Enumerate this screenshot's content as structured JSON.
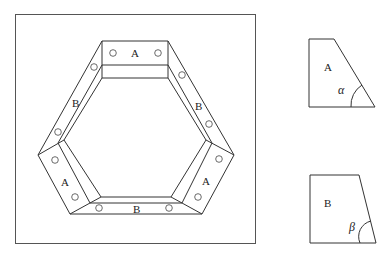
{
  "figure": {
    "frame_labels": {
      "top": "A",
      "upper_left": "B",
      "upper_right": "B",
      "lower_left": "A",
      "lower_right": "A",
      "bottom": "B"
    },
    "piece_a": {
      "label": "A",
      "angle_label": "α"
    },
    "piece_b": {
      "label": "B",
      "angle_label": "β"
    }
  }
}
